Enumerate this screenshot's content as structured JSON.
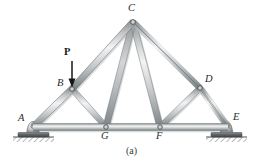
{
  "figure": {
    "caption": "(a)",
    "caption_pos": {
      "x": 126,
      "y": 146
    },
    "background_color": "#ffffff",
    "member_color": "#b9bcbd",
    "member_edge_color": "#8d9193",
    "member_highlight_color": "#eceeef",
    "ground_color": "#6f7375",
    "label_color": "#2b2b2b"
  },
  "load": {
    "label": "P",
    "label_pos": {
      "x": 59,
      "y": 52
    },
    "arrow": {
      "x": 72,
      "y_start": 62,
      "y_end": 86
    },
    "description": "downward point load at joint B"
  },
  "joints": [
    {
      "id": "A",
      "label": "A",
      "x": 33,
      "y": 127,
      "label_x": 18,
      "label_y": 118,
      "support": "pin"
    },
    {
      "id": "B",
      "label": "B",
      "x": 72,
      "y": 89,
      "label_x": 57,
      "label_y": 82,
      "support": "none"
    },
    {
      "id": "C",
      "label": "C",
      "x": 133,
      "y": 22,
      "label_x": 129,
      "label_y": 5,
      "support": "none"
    },
    {
      "id": "D",
      "label": "D",
      "x": 200,
      "y": 88,
      "label_x": 204,
      "label_y": 79,
      "support": "none"
    },
    {
      "id": "E",
      "label": "E",
      "x": 228,
      "y": 127,
      "label_x": 232,
      "label_y": 117,
      "support": "rocker"
    },
    {
      "id": "G",
      "label": "G",
      "x": 106,
      "y": 127,
      "label_x": 101,
      "label_y": 134,
      "support": "none"
    },
    {
      "id": "F",
      "label": "F",
      "x": 160,
      "y": 127,
      "label_x": 156,
      "label_y": 134,
      "support": "none"
    }
  ],
  "members": [
    {
      "id": "AG",
      "from": "A",
      "to": "G",
      "kind": "bottom-chord",
      "width": 6.5
    },
    {
      "id": "GF",
      "from": "G",
      "to": "F",
      "kind": "bottom-chord",
      "width": 6.5
    },
    {
      "id": "FE",
      "from": "F",
      "to": "E",
      "kind": "bottom-chord",
      "width": 6.5
    },
    {
      "id": "AB",
      "from": "A",
      "to": "B",
      "kind": "top-chord",
      "width": 6.0
    },
    {
      "id": "BC",
      "from": "B",
      "to": "C",
      "kind": "top-chord",
      "width": 6.0
    },
    {
      "id": "CD",
      "from": "C",
      "to": "D",
      "kind": "top-chord",
      "width": 6.0
    },
    {
      "id": "DE",
      "from": "D",
      "to": "E",
      "kind": "top-chord",
      "width": 6.0
    },
    {
      "id": "BG",
      "from": "B",
      "to": "G",
      "kind": "web",
      "width": 5.0
    },
    {
      "id": "CG",
      "from": "C",
      "to": "G",
      "kind": "web",
      "width": 5.5
    },
    {
      "id": "CF",
      "from": "C",
      "to": "F",
      "kind": "web",
      "width": 5.5
    },
    {
      "id": "DF",
      "from": "D",
      "to": "F",
      "kind": "web",
      "width": 5.0
    }
  ],
  "supports": [
    {
      "id": "support-A",
      "type": "pin",
      "joint": "A",
      "plate": {
        "x": 18,
        "y": 133,
        "width": 31,
        "height": 4
      },
      "ground": {
        "x": 13,
        "y": 137,
        "width": 41,
        "height": 5
      }
    },
    {
      "id": "support-E",
      "type": "rocker",
      "joint": "E",
      "plate": {
        "x": 211,
        "y": 133,
        "width": 31,
        "height": 4
      },
      "ground": {
        "x": 206,
        "y": 137,
        "width": 41,
        "height": 5
      }
    }
  ]
}
